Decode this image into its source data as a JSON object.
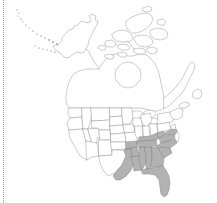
{
  "figure": {
    "kind": "species-distribution-map",
    "region": "North America",
    "title": "",
    "caption": "",
    "background_color": "#ffffff"
  },
  "legend": {
    "shaded_label": "",
    "shaded_color": "#b2b2b2",
    "unshaded_color": "#ffffff",
    "outline_color": "#8c8c8c",
    "border_color": "#9a9a9a"
  },
  "map": {
    "coastline_color": "#7d7d7d",
    "state_border_color": "#9e9e9e",
    "shaded_fill": "#b2b2b2",
    "shaded_stroke": "#7a7a7a",
    "shaded_regions": [
      "Texas (east)",
      "Oklahoma (southeast)",
      "Arkansas",
      "Louisiana",
      "Mississippi",
      "Alabama",
      "Tennessee",
      "Kentucky",
      "Florida",
      "Georgia",
      "South Carolina",
      "North Carolina",
      "Virginia",
      "West Virginia",
      "Maryland",
      "Delaware"
    ],
    "unshaded_regions": [
      "Alaska",
      "Canada",
      "Pacific Northwest",
      "Great Plains",
      "Northeast",
      "Southwest",
      "Great Lakes"
    ]
  }
}
